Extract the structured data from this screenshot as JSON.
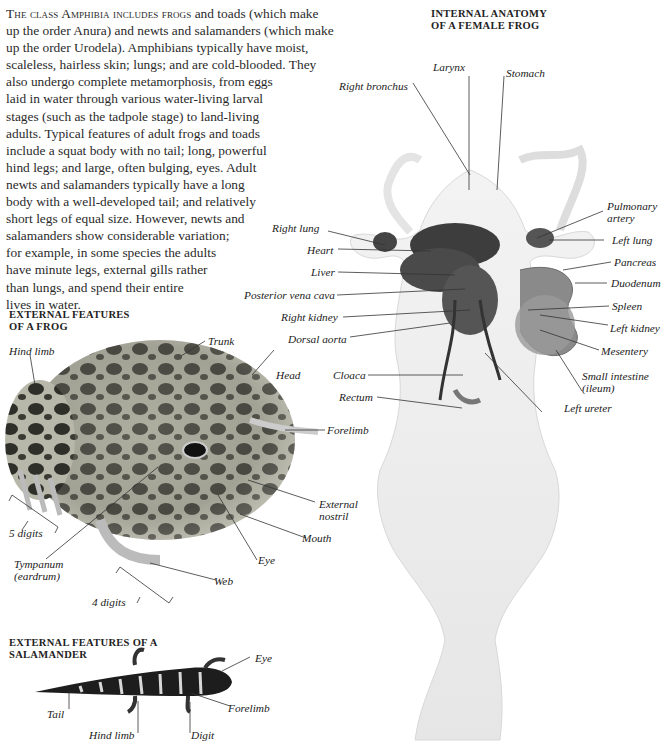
{
  "intro": {
    "lead": "The class Amphibia includes frogs",
    "lines": [
      " and toads (which make",
      "up the order Anura) and newts and salamanders (which make",
      "up the order Urodela). Amphibians typically have moist,",
      "scaleless, hairless skin; lungs; and are cold-blooded. They",
      "also undergo complete metamorphosis, from eggs",
      "laid in water through various water-living larval",
      "stages (such as the tadpole stage) to land-living",
      "adults. Typical features of adult frogs and toads",
      "include a squat body with no tail; long, powerful",
      "hind legs; and large, often bulging, eyes. Adult",
      "newts and salamanders typically have a long",
      "body with a well-developed tail; and relatively",
      "short legs of equal size. However, newts and",
      "salamanders show considerable variation;",
      "for example, in some species the adults",
      "have minute legs, external gills rather",
      "than lungs, and spend their entire",
      "lives in water."
    ]
  },
  "internal_anatomy": {
    "heading_line1": "INTERNAL ANATOMY",
    "heading_line2": "OF A FEMALE FROG",
    "labels": {
      "larynx": "Larynx",
      "stomach": "Stomach",
      "right_bronchus": "Right bronchus",
      "pulmonary_artery_1": "Pulmonary",
      "pulmonary_artery_2": "artery",
      "right_lung": "Right lung",
      "left_lung": "Left lung",
      "heart": "Heart",
      "pancreas": "Pancreas",
      "liver": "Liver",
      "duodenum": "Duodenum",
      "posterior_vena_cava": "Posterior vena cava",
      "spleen": "Spleen",
      "right_kidney": "Right kidney",
      "left_kidney": "Left kidney",
      "dorsal_aorta": "Dorsal aorta",
      "mesentery": "Mesentery",
      "small_intestine_1": "Small intestine",
      "small_intestine_2": "(ileum)",
      "cloaca": "Cloaca",
      "rectum": "Rectum",
      "left_ureter": "Left ureter"
    }
  },
  "frog_external": {
    "heading_line1": "EXTERNAL FEATURES",
    "heading_line2": "OF A FROG",
    "labels": {
      "hind_limb": "Hind limb",
      "trunk": "Trunk",
      "head": "Head",
      "forelimb": "Forelimb",
      "external_nostril_1": "External",
      "external_nostril_2": "nostril",
      "five_digits": "5 digits",
      "mouth": "Mouth",
      "eye": "Eye",
      "tympanum_1": "Tympanum",
      "tympanum_2": "(eardrum)",
      "web": "Web",
      "four_digits": "4 digits"
    }
  },
  "salamander_external": {
    "heading_line1": "EXTERNAL FEATURES OF A",
    "heading_line2": "SALAMANDER",
    "labels": {
      "eye": "Eye",
      "tail": "Tail",
      "forelimb": "Forelimb",
      "hind_limb": "Hind limb",
      "digit": "Digit"
    }
  }
}
